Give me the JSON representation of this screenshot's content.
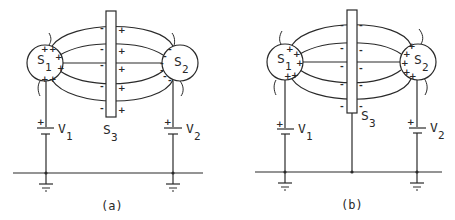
{
  "figure": {
    "panels": [
      {
        "caption": "(a)",
        "sphere_left": {
          "label": "S",
          "sub": "1",
          "charge": "+"
        },
        "sphere_right": {
          "label": "S",
          "sub": "2",
          "charge": "-"
        },
        "plate": {
          "label": "S",
          "sub": "3",
          "left_charge": "-",
          "right_charge": "+",
          "grounded": false
        },
        "battery_left": {
          "label": "V",
          "sub": "1",
          "polarity": "+"
        },
        "battery_right": {
          "label": "V",
          "sub": "2",
          "polarity": "+"
        }
      },
      {
        "caption": "(b)",
        "sphere_left": {
          "label": "S",
          "sub": "1",
          "charge": "+"
        },
        "sphere_right": {
          "label": "S",
          "sub": "2",
          "charge": "+"
        },
        "plate": {
          "label": "S",
          "sub": "3",
          "left_charge": "-",
          "right_charge": "-",
          "grounded": true
        },
        "battery_left": {
          "label": "V",
          "sub": "1",
          "polarity": "+"
        },
        "battery_right": {
          "label": "V",
          "sub": "2",
          "polarity": "+"
        }
      }
    ]
  }
}
